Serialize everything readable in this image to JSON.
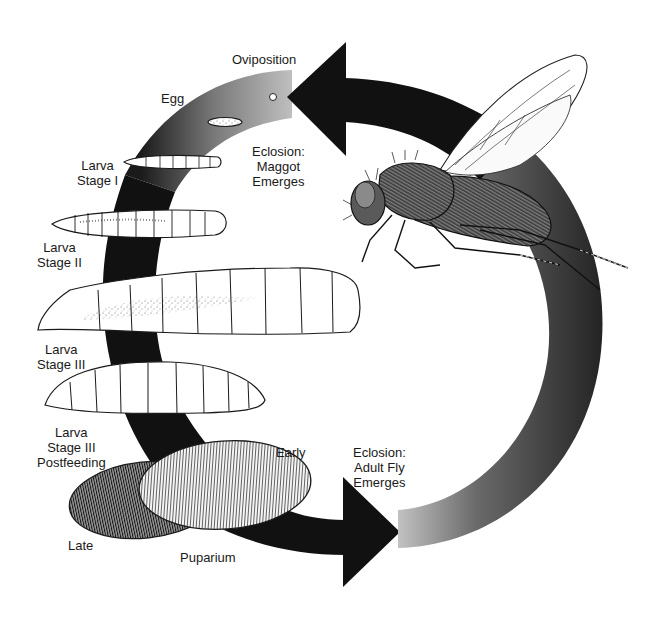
{
  "diagram": {
    "type": "life-cycle",
    "subject": "fly",
    "colors": {
      "arrow_dark": "#111111",
      "arrow_light": "#cfcfcf",
      "outline": "#1a1a1a",
      "background": "#ffffff"
    }
  },
  "labels": {
    "oviposition": "Oviposition",
    "egg": "Egg",
    "eclosion_maggot": {
      "line1": "Eclosion:",
      "line2": "Maggot",
      "line3": "Emerges"
    },
    "larva1": {
      "line1": "Larva",
      "line2": "Stage I"
    },
    "larva2": {
      "line1": "Larva",
      "line2": "Stage II"
    },
    "larva3": {
      "line1": "Larva",
      "line2": "Stage III"
    },
    "larva3_post": {
      "line1": "Larva",
      "line2": "Stage III",
      "line3": "Postfeeding"
    },
    "early": "Early",
    "late": "Late",
    "puparium": "Puparium",
    "eclosion_adult": {
      "line1": "Eclosion:",
      "line2": "Adult Fly",
      "line3": "Emerges"
    }
  },
  "stages": [
    {
      "id": "oviposition",
      "label": "Oviposition"
    },
    {
      "id": "egg",
      "label": "Egg"
    },
    {
      "id": "eclosion-maggot",
      "label": "Eclosion: Maggot Emerges"
    },
    {
      "id": "larva-1",
      "label": "Larva Stage I"
    },
    {
      "id": "larva-2",
      "label": "Larva Stage II"
    },
    {
      "id": "larva-3",
      "label": "Larva Stage III"
    },
    {
      "id": "larva-3-postfeeding",
      "label": "Larva Stage III Postfeeding"
    },
    {
      "id": "puparium-early",
      "label": "Early"
    },
    {
      "id": "puparium-late",
      "label": "Late"
    },
    {
      "id": "puparium",
      "label": "Puparium"
    },
    {
      "id": "eclosion-adult",
      "label": "Eclosion: Adult Fly Emerges"
    },
    {
      "id": "adult-fly",
      "label": ""
    }
  ]
}
